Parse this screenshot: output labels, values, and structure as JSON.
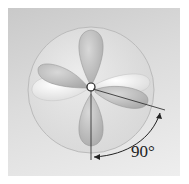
{
  "diagram": {
    "center_atom": "C",
    "angle_label": "90°",
    "colors": {
      "background": "#dcdcdc",
      "sphere": "#e6e6e6",
      "lobe_dark": "#bdbdbd",
      "lobe_light": "#f2f2f2",
      "line": "#222222"
    }
  }
}
